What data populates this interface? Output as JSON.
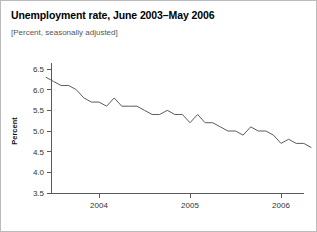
{
  "page": {
    "title": "Unemployment rate, June 2003–May 2006",
    "subtitle": "[Percent, seasonally adjusted]"
  },
  "chart_data": {
    "type": "line",
    "title": "Unemployment rate, June 2003–May 2006",
    "subtitle": "[Percent, seasonally adjusted]",
    "xlabel": "",
    "ylabel": "Percent",
    "ylim": [
      3.5,
      6.5
    ],
    "yticks": [
      3.5,
      4.0,
      4.5,
      5.0,
      5.5,
      6.0,
      6.5
    ],
    "ytick_labels": [
      "3.5",
      "4.0",
      "4.5",
      "5.0",
      "5.5",
      "6.0",
      "6.5"
    ],
    "xlim": [
      "2003-06",
      "2006-05"
    ],
    "xticks": [
      "2004-01",
      "2005-01",
      "2006-01"
    ],
    "xtick_labels": [
      "2004",
      "2005",
      "2006"
    ],
    "grid": false,
    "legend": false,
    "line_color": "#5b5b5b",
    "x": [
      "2003-06",
      "2003-07",
      "2003-08",
      "2003-09",
      "2003-10",
      "2003-11",
      "2003-12",
      "2004-01",
      "2004-02",
      "2004-03",
      "2004-04",
      "2004-05",
      "2004-06",
      "2004-07",
      "2004-08",
      "2004-09",
      "2004-10",
      "2004-11",
      "2004-12",
      "2005-01",
      "2005-02",
      "2005-03",
      "2005-04",
      "2005-05",
      "2005-06",
      "2005-07",
      "2005-08",
      "2005-09",
      "2005-10",
      "2005-11",
      "2005-12",
      "2006-01",
      "2006-02",
      "2006-03",
      "2006-04",
      "2006-05"
    ],
    "values": [
      6.3,
      6.2,
      6.1,
      6.1,
      6.0,
      5.8,
      5.7,
      5.7,
      5.6,
      5.8,
      5.6,
      5.6,
      5.6,
      5.5,
      5.4,
      5.4,
      5.5,
      5.4,
      5.4,
      5.2,
      5.4,
      5.2,
      5.2,
      5.1,
      5.0,
      5.0,
      4.9,
      5.1,
      5.0,
      5.0,
      4.9,
      4.7,
      4.8,
      4.7,
      4.7,
      4.6
    ],
    "series": [
      {
        "name": "Unemployment rate",
        "values": [
          6.3,
          6.2,
          6.1,
          6.1,
          6.0,
          5.8,
          5.7,
          5.7,
          5.6,
          5.8,
          5.6,
          5.6,
          5.6,
          5.5,
          5.4,
          5.4,
          5.5,
          5.4,
          5.4,
          5.2,
          5.4,
          5.2,
          5.2,
          5.1,
          5.0,
          5.0,
          4.9,
          5.1,
          5.0,
          5.0,
          4.9,
          4.7,
          4.8,
          4.7,
          4.7,
          4.6
        ]
      }
    ]
  }
}
